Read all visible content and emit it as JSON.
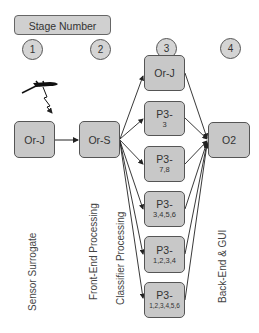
{
  "header": {
    "label": "Stage Number"
  },
  "stages": [
    {
      "number": "1",
      "label": "Sensor Surrogate"
    },
    {
      "number": "2",
      "label": "Front-End Processing"
    },
    {
      "number": "3",
      "label": "Classifier Processing"
    },
    {
      "number": "4",
      "label": "Back-End & GUI"
    }
  ],
  "nodes": {
    "sensor_orj": {
      "main": "Or-J",
      "sub": ""
    },
    "ors": {
      "main": "Or-S",
      "sub": ""
    },
    "classifiers": [
      {
        "main": "Or-J",
        "sub": ""
      },
      {
        "main": "P3-",
        "sub": "3"
      },
      {
        "main": "P3-",
        "sub": "7,8"
      },
      {
        "main": "P3-",
        "sub": "3,4,5,6"
      },
      {
        "main": "P3-",
        "sub": "1,2,3,4"
      },
      {
        "main": "P3-",
        "sub": "1,2,3,4,5,6"
      }
    ],
    "o2": {
      "main": "O2",
      "sub": ""
    }
  },
  "icons": {
    "sensor": "uav-aircraft-icon",
    "signal": "lightning-signal-icon"
  },
  "colors": {
    "node_fill": "#c8c8c8",
    "node_border": "#555555",
    "edge": "#222222"
  }
}
